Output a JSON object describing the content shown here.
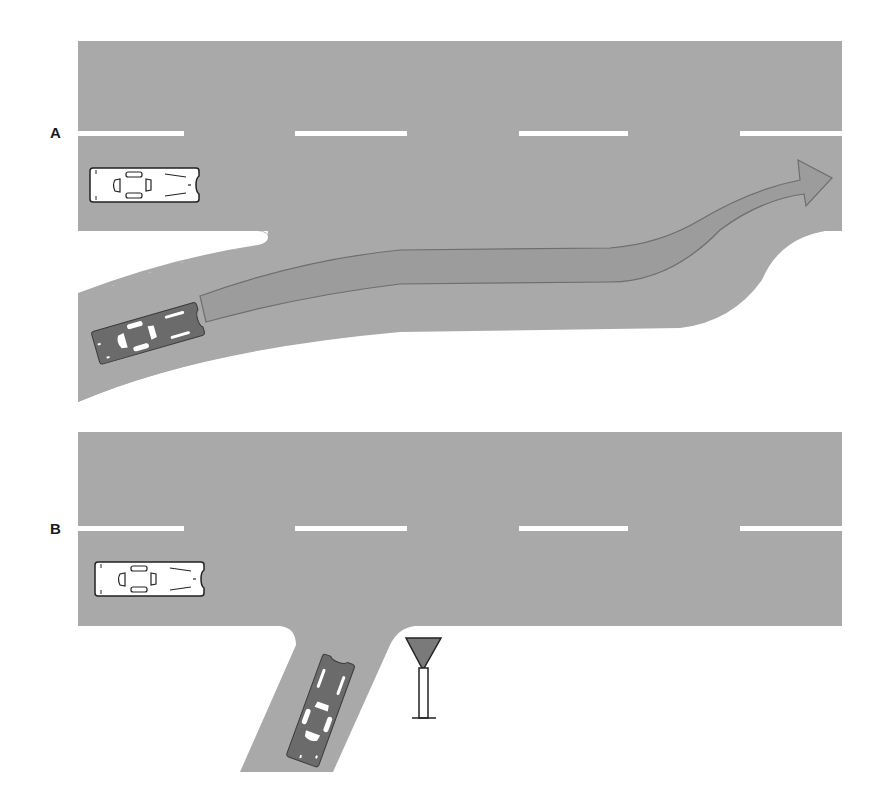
{
  "figure": {
    "panels": [
      {
        "label": "A",
        "description": "Vehicle merging from an acceleration lane onto a main road; curved arrow shows merge path",
        "elements": [
          "main-road",
          "entry-ramp",
          "white-car",
          "dark-car",
          "merge-arrow"
        ]
      },
      {
        "label": "B",
        "description": "Vehicle on a side road approaching a T-junction with a yield sign",
        "elements": [
          "main-road",
          "side-road",
          "white-car",
          "dark-car",
          "yield-sign"
        ]
      }
    ],
    "colors": {
      "road": "#a9a9a9",
      "arrow_fill": "#9c9c9c",
      "arrow_stroke": "#6e6e6e",
      "lane_marking": "#ffffff",
      "dark_car": "#6b6b6b",
      "white_car": "#ffffff",
      "yield_sign": "#7a7a7a",
      "label": "#1a1a1a"
    }
  }
}
